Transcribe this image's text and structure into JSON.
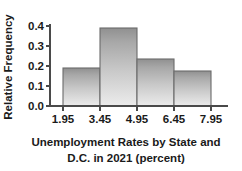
{
  "chart_data": {
    "type": "bar",
    "title": "",
    "subtitle": "",
    "xlabel_line1": "Unemployment Rates by State and",
    "xlabel_line2": "D.C. in 2021 (percent)",
    "xlabel": "Unemployment Rates by State and D.C. in 2021 (percent)",
    "ylabel": "Relative Frequency",
    "categories": [
      "1.95-3.45",
      "3.45-4.95",
      "4.95-6.45",
      "6.45-7.95"
    ],
    "bin_edges": [
      1.95,
      3.45,
      4.95,
      6.45,
      7.95
    ],
    "values": [
      0.19,
      0.39,
      0.235,
      0.175
    ],
    "xtick_labels": [
      "1.95",
      "3.45",
      "4.95",
      "6.45",
      "7.95"
    ],
    "ytick_labels": [
      "0.0",
      "0.1",
      "0.2",
      "0.3",
      "0.4"
    ],
    "ytick_values": [
      0.0,
      0.1,
      0.2,
      0.3,
      0.4
    ],
    "ylim": [
      0.0,
      0.4
    ],
    "xlim": [
      1.95,
      7.95
    ],
    "grid": false,
    "legend": null,
    "bar_fill_top": "#9a9a9a",
    "bar_fill_bottom": "#e8e8e8",
    "bar_edge_color": "#6b6b6b",
    "axis_color": "#4a4a4a",
    "text_color": "#1a1a1a",
    "background": "#ffffff"
  }
}
